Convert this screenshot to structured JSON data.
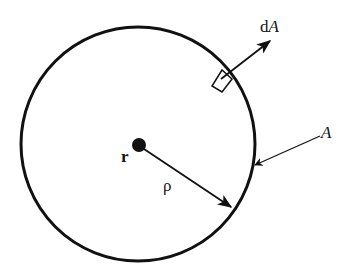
{
  "diagram": {
    "type": "surface-integral sketch",
    "colors": {
      "stroke": "#111111",
      "background": "#ffffff"
    },
    "circle": {
      "cx": 138,
      "cy": 144,
      "r": 117,
      "label": "A"
    },
    "point": {
      "label": "r",
      "cx": 138,
      "cy": 144
    },
    "radius_vector": {
      "label": "ρ"
    },
    "area_element": {
      "label_prefix": "d",
      "label_var": "A"
    },
    "labels": {
      "point": "r",
      "radius": "ρ",
      "surface": "A",
      "dA_d": "d",
      "dA_A": "A"
    }
  }
}
